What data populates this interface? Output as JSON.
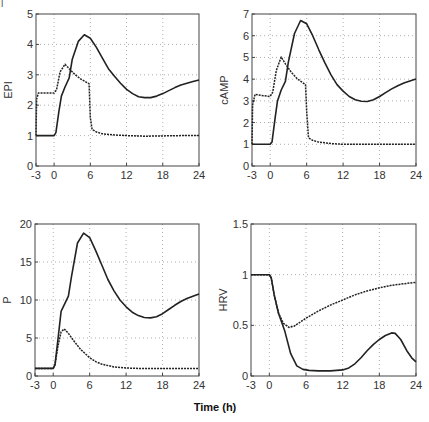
{
  "figure": {
    "xlabel": "Time (h)",
    "corner_mark": "|"
  },
  "chart_data": [
    {
      "type": "line",
      "title": "",
      "ylabel": "EPI",
      "xlim": [
        -3,
        24
      ],
      "ylim": [
        0,
        5
      ],
      "xticks": [
        -3,
        0,
        6,
        12,
        18,
        24
      ],
      "yticks": [
        0,
        1,
        2,
        3,
        4,
        5
      ],
      "grid": true,
      "series": [
        {
          "name": "solid",
          "style": "solid",
          "x": [
            -3,
            0,
            0.3,
            0.8,
            1.2,
            1.8,
            2.5,
            3,
            4,
            5,
            6,
            7,
            8,
            9,
            10,
            11,
            12,
            13,
            14,
            15,
            16,
            17,
            18,
            19,
            20,
            21,
            22,
            23,
            24
          ],
          "y": [
            1,
            1,
            1.1,
            1.8,
            2.3,
            2.6,
            2.9,
            3.5,
            4.1,
            4.32,
            4.2,
            3.9,
            3.55,
            3.2,
            2.95,
            2.72,
            2.52,
            2.38,
            2.28,
            2.25,
            2.25,
            2.3,
            2.38,
            2.48,
            2.58,
            2.66,
            2.72,
            2.78,
            2.83
          ]
        },
        {
          "name": "dashed",
          "style": "dashed",
          "x": [
            -3,
            -2.9,
            -2.6,
            0,
            0.4,
            1,
            1.8,
            2.5,
            3.5,
            4.5,
            5.8,
            6.0,
            6.3,
            7,
            8,
            10,
            12,
            15,
            18,
            21,
            24
          ],
          "y": [
            1,
            2.2,
            2.4,
            2.4,
            2.5,
            3.1,
            3.35,
            3.2,
            3.0,
            2.85,
            2.7,
            1.6,
            1.2,
            1.12,
            1.06,
            1.02,
            1.0,
            0.98,
            0.99,
            1.0,
            1.0
          ]
        }
      ]
    },
    {
      "type": "line",
      "title": "",
      "ylabel": "cAMP",
      "xlim": [
        -3,
        24
      ],
      "ylim": [
        0,
        7
      ],
      "xticks": [
        -3,
        0,
        6,
        12,
        18,
        24
      ],
      "yticks": [
        0,
        1,
        2,
        3,
        4,
        5,
        6,
        7
      ],
      "grid": true,
      "series": [
        {
          "name": "solid",
          "style": "solid",
          "x": [
            -3,
            0,
            0.3,
            0.8,
            1.2,
            1.8,
            2.5,
            3,
            4,
            5,
            6,
            7,
            8,
            9,
            10,
            11,
            12,
            13,
            14,
            15,
            16,
            17,
            18,
            19,
            20,
            21,
            22,
            23,
            24
          ],
          "y": [
            1,
            1,
            1.1,
            2.2,
            3.0,
            3.5,
            3.9,
            4.8,
            6.1,
            6.7,
            6.55,
            6.0,
            5.35,
            4.75,
            4.2,
            3.75,
            3.45,
            3.2,
            3.05,
            2.98,
            2.97,
            3.05,
            3.2,
            3.38,
            3.55,
            3.7,
            3.82,
            3.92,
            4.0
          ]
        },
        {
          "name": "dashed",
          "style": "dashed",
          "x": [
            -3,
            -2.9,
            -2.5,
            -1.5,
            0,
            0.4,
            1,
            1.8,
            2.5,
            3.5,
            4.5,
            5.8,
            6.0,
            6.3,
            7,
            8,
            10,
            12,
            15,
            18,
            21,
            24
          ],
          "y": [
            1,
            2.8,
            3.3,
            3.25,
            3.2,
            3.4,
            4.4,
            5.02,
            4.7,
            4.3,
            4.0,
            3.75,
            2.5,
            1.3,
            1.18,
            1.1,
            1.03,
            1.0,
            1.0,
            1.0,
            1.0,
            1.0
          ]
        }
      ]
    },
    {
      "type": "line",
      "title": "",
      "ylabel": "P",
      "xlim": [
        -3,
        24
      ],
      "ylim": [
        0,
        20
      ],
      "xticks": [
        -3,
        0,
        6,
        12,
        18,
        24
      ],
      "yticks": [
        0,
        5,
        10,
        15,
        20
      ],
      "grid": true,
      "series": [
        {
          "name": "solid",
          "style": "solid",
          "x": [
            -3,
            0,
            0.3,
            0.8,
            1.3,
            2,
            2.5,
            3,
            4,
            5,
            6,
            7,
            8,
            9,
            10,
            11,
            12,
            13,
            14,
            15,
            16,
            17,
            18,
            19,
            20,
            21,
            22,
            23,
            24
          ],
          "y": [
            1,
            1,
            1.5,
            5,
            8.5,
            9.7,
            10.5,
            13,
            17.5,
            18.8,
            18.2,
            16.5,
            14.6,
            12.7,
            11.2,
            10,
            9.1,
            8.4,
            7.95,
            7.7,
            7.65,
            7.8,
            8.2,
            8.75,
            9.3,
            9.8,
            10.2,
            10.5,
            10.8
          ]
        },
        {
          "name": "dashed",
          "style": "dashed",
          "x": [
            -3,
            0,
            0.3,
            0.8,
            1.3,
            1.8,
            2.5,
            3.5,
            4.5,
            6,
            7,
            8,
            10,
            12,
            15,
            18,
            21,
            24
          ],
          "y": [
            1,
            1,
            1.5,
            4.0,
            5.8,
            6.2,
            5.6,
            4.5,
            3.5,
            2.4,
            1.9,
            1.55,
            1.2,
            1.05,
            0.97,
            0.97,
            0.98,
            1.0
          ]
        }
      ]
    },
    {
      "type": "line",
      "title": "",
      "ylabel": "HRV",
      "xlim": [
        -3,
        24
      ],
      "ylim": [
        0,
        1.5
      ],
      "xticks": [
        -3,
        0,
        6,
        12,
        18,
        24
      ],
      "yticks": [
        0,
        0.5,
        1,
        1.5
      ],
      "ytick_labels": [
        "0",
        "0.5",
        "1",
        "1.5"
      ],
      "grid": true,
      "series": [
        {
          "name": "solid",
          "style": "solid",
          "x": [
            -3,
            0,
            0.3,
            0.8,
            1.5,
            2.5,
            3.5,
            4.5,
            5.5,
            6.5,
            8,
            10,
            12,
            13,
            14,
            15,
            16,
            17,
            18,
            19,
            20,
            20.6,
            21.5,
            22.5,
            23.3,
            24
          ],
          "y": [
            1,
            1,
            0.97,
            0.8,
            0.62,
            0.45,
            0.22,
            0.1,
            0.065,
            0.055,
            0.05,
            0.05,
            0.06,
            0.08,
            0.12,
            0.18,
            0.25,
            0.31,
            0.36,
            0.4,
            0.425,
            0.42,
            0.36,
            0.25,
            0.18,
            0.14
          ]
        },
        {
          "name": "dashed",
          "style": "dashed",
          "x": [
            -3,
            0,
            0.3,
            0.8,
            1.5,
            2.3,
            3.2,
            4,
            5,
            6,
            8,
            10,
            12,
            14,
            16,
            18,
            20,
            22,
            24
          ],
          "y": [
            1,
            1,
            0.97,
            0.8,
            0.62,
            0.52,
            0.48,
            0.49,
            0.53,
            0.57,
            0.64,
            0.7,
            0.75,
            0.8,
            0.84,
            0.87,
            0.895,
            0.91,
            0.925
          ]
        }
      ]
    }
  ]
}
